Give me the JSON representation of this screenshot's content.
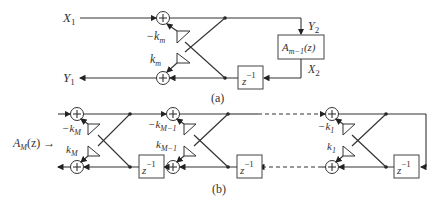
{
  "diagram_a": {
    "caption": "(a)",
    "input_x1": "X",
    "input_x1_sub": "1",
    "output_y1": "Y",
    "output_y1_sub": "1",
    "y2": "Y",
    "y2_sub": "2",
    "x2": "X",
    "x2_sub": "2",
    "coef_top": "−k",
    "coef_top_sub": "m",
    "coef_bottom": "k",
    "coef_bottom_sub": "m",
    "allpass_block": "A",
    "allpass_block_sub": "m−1",
    "allpass_block_arg": "(z)",
    "delay": "z",
    "delay_sup": "−1"
  },
  "diagram_b": {
    "caption": "(b)",
    "transfer_label": "A",
    "transfer_label_sub": "M",
    "transfer_label_arg": "(z) →",
    "stages": [
      {
        "coef_top": "−k",
        "coef_top_sub": "M",
        "coef_bottom": "k",
        "coef_bottom_sub": "M"
      },
      {
        "coef_top": "−k",
        "coef_top_sub": "M−1",
        "coef_bottom": "k",
        "coef_bottom_sub": "M−1"
      },
      {
        "coef_top": "−k",
        "coef_top_sub": "1",
        "coef_bottom": "k",
        "coef_bottom_sub": "1"
      }
    ],
    "delay": "z",
    "delay_sup": "−1"
  }
}
